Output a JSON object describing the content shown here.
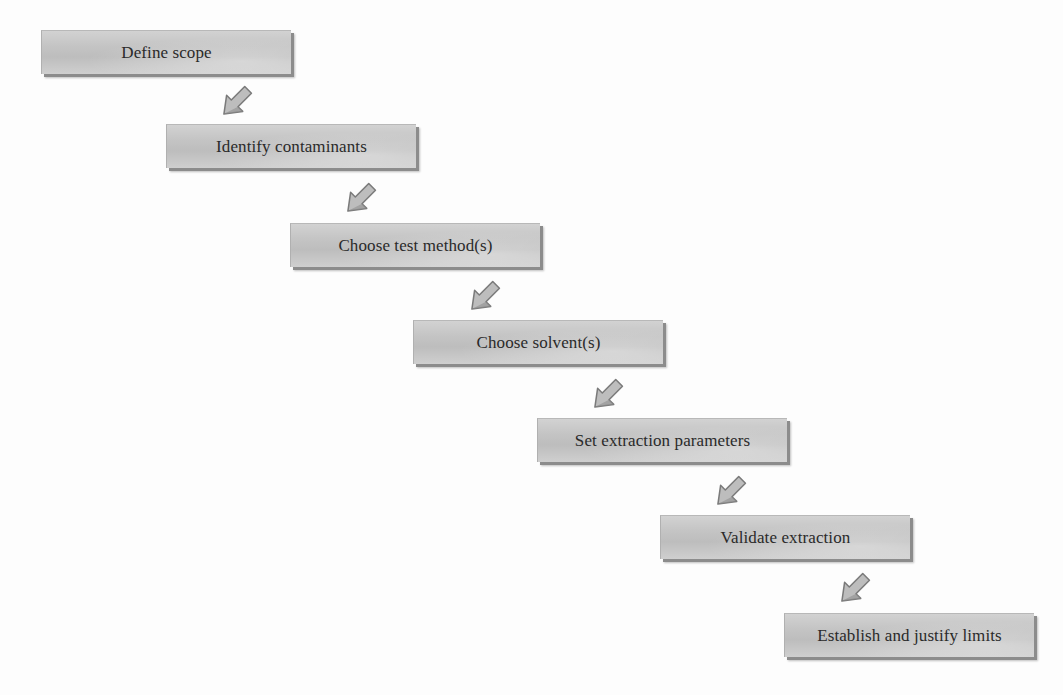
{
  "diagram": {
    "type": "sequential-flow",
    "direction": "top-left to bottom-right staircase",
    "steps": [
      {
        "id": 1,
        "label": "Define scope",
        "x": 41,
        "y": 30
      },
      {
        "id": 2,
        "label": "Identify contaminants",
        "x": 166,
        "y": 124
      },
      {
        "id": 3,
        "label": "Choose test method(s)",
        "x": 290,
        "y": 223
      },
      {
        "id": 4,
        "label": "Choose solvent(s)",
        "x": 413,
        "y": 320
      },
      {
        "id": 5,
        "label": "Set extraction parameters",
        "x": 537,
        "y": 418
      },
      {
        "id": 6,
        "label": "Validate extraction",
        "x": 660,
        "y": 515
      },
      {
        "id": 7,
        "label": "Establish and justify limits",
        "x": 784,
        "y": 613
      }
    ],
    "arrows": [
      {
        "from": 1,
        "to": 2,
        "x": 217,
        "y": 83
      },
      {
        "from": 2,
        "to": 3,
        "x": 341,
        "y": 180
      },
      {
        "from": 3,
        "to": 4,
        "x": 465,
        "y": 278
      },
      {
        "from": 4,
        "to": 5,
        "x": 588,
        "y": 376
      },
      {
        "from": 5,
        "to": 6,
        "x": 711,
        "y": 473
      },
      {
        "from": 6,
        "to": 7,
        "x": 835,
        "y": 570
      }
    ],
    "colors": {
      "box_fill": "#c4c4c4",
      "box_shadow": "#8c8c8c",
      "text": "#2a2a2a",
      "arrow_fill": "#bdbdbd",
      "arrow_outline": "#7a7a7a",
      "background": "#fdfdfd"
    }
  }
}
